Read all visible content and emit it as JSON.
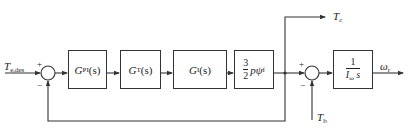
{
  "diagram": {
    "type": "control-block-diagram",
    "input": {
      "symbol": "T",
      "subscript": "e,des"
    },
    "sum1": {
      "plus": "+",
      "minus": "−"
    },
    "blocks": [
      {
        "id": "pi",
        "symbol": "G",
        "subscript": "PI",
        "arg": "(s)"
      },
      {
        "id": "t",
        "symbol": "G",
        "subscript": "T",
        "arg": "(s)"
      },
      {
        "id": "i",
        "symbol": "G",
        "subscript": "I",
        "arg": "(s)"
      },
      {
        "id": "torque",
        "num": "3",
        "den": "2",
        "rest": "pψ",
        "rest_sub": "f"
      },
      {
        "id": "plant",
        "num": "1",
        "den_symbol": "I",
        "den_sub": "ω",
        "den_rest": " s"
      }
    ],
    "branch_output": {
      "symbol": "T",
      "subscript": "c"
    },
    "sum2": {
      "plus": "+",
      "minus": "−"
    },
    "disturbance": {
      "symbol": "T",
      "subscript": "b"
    },
    "output": {
      "symbol": "ω",
      "subscript": "r"
    },
    "colors": {
      "line": "#333333",
      "background": "#ffffff"
    }
  }
}
